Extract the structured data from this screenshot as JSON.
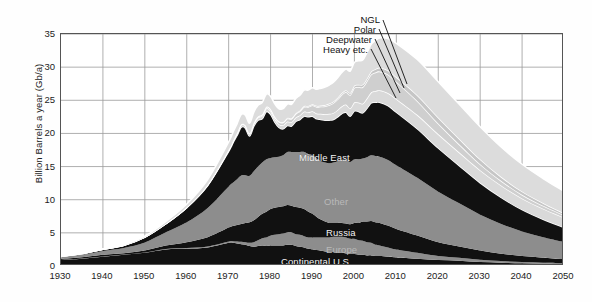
{
  "chart_data": {
    "type": "area",
    "title": "",
    "subtitle": "",
    "xlabel": "",
    "ylabel": "Billion Barrels a year (Gb/a)",
    "xlim": [
      1930,
      2050
    ],
    "ylim": [
      0,
      35
    ],
    "grid": true,
    "legend_position": "in-plot annotations",
    "stacked": true,
    "x": [
      1930,
      1935,
      1940,
      1945,
      1950,
      1955,
      1960,
      1965,
      1970,
      1971,
      1972,
      1973,
      1974,
      1975,
      1976,
      1977,
      1978,
      1979,
      1980,
      1981,
      1982,
      1983,
      1984,
      1985,
      1986,
      1987,
      1988,
      1989,
      1990,
      1991,
      1992,
      1993,
      1994,
      1995,
      1996,
      1997,
      1998,
      1999,
      2000,
      2001,
      2002,
      2003,
      2004,
      2005,
      2006,
      2008,
      2010,
      2015,
      2020,
      2025,
      2030,
      2035,
      2040,
      2045,
      2050
    ],
    "x_ticks": [
      1930,
      1940,
      1950,
      1960,
      1970,
      1980,
      1990,
      2000,
      2010,
      2020,
      2030,
      2040,
      2050
    ],
    "y_ticks": [
      0,
      5,
      10,
      15,
      20,
      25,
      30,
      35
    ],
    "series": [
      {
        "name": "Continental U.S.",
        "color": "#111111",
        "label_color": "dark",
        "values": [
          0.9,
          1.1,
          1.4,
          1.7,
          2.0,
          2.5,
          2.6,
          2.8,
          3.5,
          3.5,
          3.4,
          3.3,
          3.2,
          3.0,
          2.9,
          3.0,
          3.1,
          3.0,
          3.1,
          3.1,
          3.1,
          3.1,
          3.2,
          3.2,
          3.0,
          2.9,
          2.8,
          2.6,
          2.5,
          2.4,
          2.3,
          2.2,
          2.1,
          2.1,
          2.0,
          2.0,
          1.9,
          1.8,
          1.8,
          1.7,
          1.7,
          1.6,
          1.6,
          1.5,
          1.5,
          1.4,
          1.3,
          1.1,
          0.9,
          0.8,
          0.6,
          0.5,
          0.4,
          0.35,
          0.3
        ]
      },
      {
        "name": "Europe",
        "color": "#8d8d8d",
        "label_color": "faint",
        "values": [
          0.02,
          0.02,
          0.03,
          0.03,
          0.05,
          0.08,
          0.1,
          0.15,
          0.2,
          0.25,
          0.3,
          0.35,
          0.4,
          0.5,
          0.7,
          0.9,
          1.1,
          1.3,
          1.5,
          1.6,
          1.7,
          1.8,
          1.9,
          1.9,
          1.8,
          1.8,
          1.7,
          1.7,
          1.8,
          1.9,
          2.0,
          2.1,
          2.2,
          2.3,
          2.4,
          2.4,
          2.4,
          2.3,
          2.3,
          2.2,
          2.1,
          2.0,
          1.9,
          1.7,
          1.6,
          1.4,
          1.2,
          0.9,
          0.6,
          0.45,
          0.35,
          0.25,
          0.2,
          0.15,
          0.12
        ]
      },
      {
        "name": "Russia",
        "color": "#111111",
        "label_color": "light",
        "values": [
          0.15,
          0.2,
          0.25,
          0.2,
          0.3,
          0.5,
          0.9,
          1.4,
          2.1,
          2.3,
          2.5,
          2.7,
          2.9,
          3.1,
          3.3,
          3.5,
          3.7,
          3.9,
          4.0,
          4.1,
          4.1,
          4.1,
          4.1,
          4.0,
          4.1,
          4.1,
          4.1,
          3.9,
          3.6,
          3.1,
          2.7,
          2.4,
          2.2,
          2.1,
          2.1,
          2.1,
          2.1,
          2.2,
          2.4,
          2.6,
          2.9,
          3.1,
          3.3,
          3.4,
          3.4,
          3.3,
          3.1,
          2.6,
          2.1,
          1.7,
          1.4,
          1.1,
          0.9,
          0.75,
          0.6
        ]
      },
      {
        "name": "Other",
        "color": "#8d8d8d",
        "label_color": "faint",
        "values": [
          0.3,
          0.4,
          0.6,
          0.8,
          1.2,
          2.0,
          3.0,
          4.4,
          6.2,
          6.5,
          6.9,
          7.3,
          7.2,
          7.0,
          7.4,
          7.6,
          7.7,
          7.9,
          7.7,
          7.6,
          7.6,
          7.7,
          8.0,
          8.1,
          8.3,
          8.4,
          8.6,
          8.7,
          8.8,
          8.8,
          8.8,
          8.9,
          9.0,
          9.1,
          9.3,
          9.5,
          9.6,
          9.4,
          9.6,
          9.6,
          9.5,
          9.7,
          9.9,
          10.0,
          10.0,
          9.9,
          9.6,
          8.7,
          7.6,
          6.5,
          5.4,
          4.5,
          3.7,
          3.1,
          2.6
        ]
      },
      {
        "name": "Middle East",
        "color": "#111111",
        "label_color": "light",
        "values": [
          0.08,
          0.15,
          0.25,
          0.4,
          0.8,
          1.3,
          2.2,
          3.4,
          5.3,
          6.0,
          6.6,
          7.3,
          7.1,
          6.0,
          6.8,
          7.0,
          6.6,
          7.2,
          6.6,
          5.3,
          4.4,
          4.0,
          4.0,
          3.9,
          4.6,
          4.9,
          5.4,
          5.6,
          5.9,
          6.0,
          6.3,
          6.4,
          6.5,
          6.5,
          6.7,
          7.0,
          7.2,
          6.9,
          7.3,
          7.2,
          6.9,
          7.4,
          7.9,
          8.1,
          8.2,
          8.2,
          8.0,
          7.4,
          6.6,
          5.7,
          4.8,
          4.0,
          3.3,
          2.7,
          2.2
        ]
      },
      {
        "name": "Heavy etc.",
        "color": "#d9d9d9",
        "label_color": "dark",
        "values": [
          0.0,
          0.0,
          0.0,
          0.0,
          0.0,
          0.0,
          0.05,
          0.1,
          0.2,
          0.25,
          0.3,
          0.35,
          0.35,
          0.35,
          0.4,
          0.4,
          0.45,
          0.5,
          0.5,
          0.5,
          0.5,
          0.55,
          0.6,
          0.6,
          0.6,
          0.65,
          0.7,
          0.7,
          0.75,
          0.8,
          0.85,
          0.9,
          0.95,
          1.0,
          1.05,
          1.1,
          1.15,
          1.2,
          1.3,
          1.35,
          1.4,
          1.5,
          1.6,
          1.7,
          1.8,
          1.9,
          2.0,
          2.1,
          2.1,
          2.0,
          1.9,
          1.8,
          1.7,
          1.6,
          1.5
        ]
      },
      {
        "name": "Deepwater",
        "color": "#cfcfcf",
        "label_color": "dark",
        "values": [
          0.0,
          0.0,
          0.0,
          0.0,
          0.0,
          0.0,
          0.0,
          0.0,
          0.02,
          0.03,
          0.05,
          0.07,
          0.08,
          0.1,
          0.12,
          0.15,
          0.18,
          0.2,
          0.25,
          0.3,
          0.35,
          0.4,
          0.45,
          0.5,
          0.55,
          0.6,
          0.7,
          0.8,
          0.9,
          1.0,
          1.1,
          1.2,
          1.35,
          1.5,
          1.6,
          1.75,
          1.9,
          2.0,
          2.2,
          2.35,
          2.5,
          2.6,
          2.7,
          2.8,
          2.85,
          2.8,
          2.6,
          2.1,
          1.6,
          1.2,
          0.9,
          0.7,
          0.55,
          0.45,
          0.35
        ]
      },
      {
        "name": "Polar",
        "color": "#c6c6c6",
        "label_color": "dark",
        "values": [
          0.0,
          0.0,
          0.0,
          0.0,
          0.0,
          0.0,
          0.0,
          0.0,
          0.0,
          0.0,
          0.0,
          0.0,
          0.0,
          0.0,
          0.0,
          0.0,
          0.02,
          0.03,
          0.05,
          0.06,
          0.07,
          0.08,
          0.09,
          0.1,
          0.11,
          0.12,
          0.13,
          0.14,
          0.15,
          0.16,
          0.17,
          0.18,
          0.2,
          0.22,
          0.24,
          0.26,
          0.28,
          0.3,
          0.32,
          0.35,
          0.38,
          0.4,
          0.45,
          0.5,
          0.55,
          0.6,
          0.7,
          0.85,
          0.9,
          0.85,
          0.75,
          0.6,
          0.5,
          0.4,
          0.3
        ]
      },
      {
        "name": "NGL",
        "color": "#dcdcdc",
        "label_color": "dark",
        "values": [
          0.02,
          0.03,
          0.05,
          0.08,
          0.15,
          0.3,
          0.5,
          0.8,
          1.2,
          1.3,
          1.4,
          1.5,
          1.5,
          1.5,
          1.6,
          1.7,
          1.8,
          1.9,
          1.9,
          1.9,
          1.9,
          2.0,
          2.1,
          2.1,
          2.2,
          2.3,
          2.4,
          2.4,
          2.5,
          2.5,
          2.6,
          2.7,
          2.8,
          2.9,
          3.0,
          3.1,
          3.2,
          3.3,
          3.5,
          3.6,
          3.7,
          3.9,
          4.1,
          4.3,
          4.5,
          4.8,
          5.1,
          5.4,
          5.4,
          5.2,
          4.9,
          4.5,
          4.1,
          3.7,
          3.3
        ]
      }
    ],
    "annotations": [
      {
        "text": "NGL",
        "kind": "callout"
      },
      {
        "text": "Polar",
        "kind": "callout"
      },
      {
        "text": "Deepwater",
        "kind": "callout"
      },
      {
        "text": "Heavy etc.",
        "kind": "callout"
      },
      {
        "text": "Middle East",
        "kind": "band"
      },
      {
        "text": "Other",
        "kind": "band"
      },
      {
        "text": "Russia",
        "kind": "band"
      },
      {
        "text": "Europe",
        "kind": "band"
      },
      {
        "text": "Continental U.S.",
        "kind": "band"
      }
    ]
  },
  "axes": {
    "y_title": "Billion Barrels a year (Gb/a)",
    "y_ticks": [
      "0",
      "5",
      "10",
      "15",
      "20",
      "25",
      "30",
      "35"
    ],
    "x_ticks": [
      "1930",
      "1940",
      "1950",
      "1960",
      "1970",
      "1980",
      "1990",
      "2000",
      "2010",
      "2020",
      "2030",
      "2040",
      "2050"
    ]
  },
  "callouts": {
    "ngl": "NGL",
    "polar": "Polar",
    "deepwater": "Deepwater",
    "heavy": "Heavy etc."
  },
  "band_labels": {
    "middle_east": "Middle East",
    "other": "Other",
    "russia": "Russia",
    "europe": "Europe",
    "continental_us": "Continental U.S."
  },
  "colors": {
    "dark_band": "#111111",
    "mid_band": "#8d8d8d",
    "light_band": "#d9d9d9",
    "grid": "#9a9a9a",
    "frame": "#555555",
    "background": "#ffffff",
    "separator": "#ffffff"
  }
}
